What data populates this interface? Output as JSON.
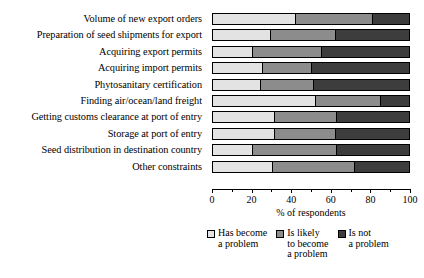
{
  "chart_data": {
    "type": "bar",
    "orientation": "horizontal",
    "stacked": true,
    "title": "",
    "xlabel": "% of respondents",
    "ylabel": "",
    "xlim": [
      0,
      100
    ],
    "xticks": [
      0,
      20,
      40,
      60,
      80,
      100
    ],
    "xtick_labels": [
      "0",
      "20",
      "40",
      "60",
      "80",
      "100"
    ],
    "minor_xticks": [
      10,
      30,
      50,
      70,
      90
    ],
    "grid": false,
    "legend_position": "bottom",
    "categories": [
      "Volume of new export orders",
      "Preparation of seed shipments for export",
      "Acquiring export permits",
      "Acquiring import permits",
      "Phytosanitary certification",
      "Finding air/ocean/land freight",
      "Getting customs clearance at port of entry",
      "Storage at port of entry",
      "Seed distribution in destination country",
      "Other constraints"
    ],
    "series": [
      {
        "name": "Has become a problem",
        "color": "#e3e3e3",
        "values": [
          42,
          29,
          20,
          25,
          24,
          52,
          31,
          31,
          20,
          30
        ]
      },
      {
        "name": "Is likely to become a problem",
        "color": "#8c8c8c",
        "values": [
          39,
          33,
          35,
          25,
          27,
          33,
          32,
          31,
          43,
          42
        ]
      },
      {
        "name": "Is not a problem",
        "color": "#3d3d3d",
        "values": [
          19,
          38,
          45,
          50,
          49,
          15,
          37,
          38,
          37,
          28
        ]
      }
    ]
  },
  "legend": {
    "items": [
      {
        "label": "Has become\na problem",
        "color": "#e3e3e3"
      },
      {
        "label": "Is likely\nto become\na problem",
        "color": "#8c8c8c"
      },
      {
        "label": "Is not\na problem",
        "color": "#3d3d3d"
      }
    ]
  },
  "axis": {
    "x_title": "% of respondents"
  }
}
